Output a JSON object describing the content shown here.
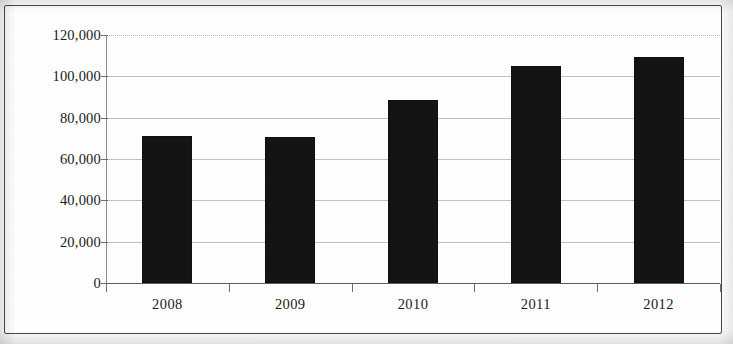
{
  "chart_data": {
    "type": "bar",
    "title": "",
    "subtitle": "",
    "xlabel": "",
    "ylabel": "",
    "categories": [
      "2008",
      "2009",
      "2010",
      "2011",
      "2012"
    ],
    "values": [
      71000,
      70500,
      88500,
      105000,
      109500
    ],
    "series": [
      {
        "name": "",
        "values": [
          71000,
          70500,
          88500,
          105000,
          109500
        ]
      }
    ],
    "ylim": [
      0,
      120000
    ],
    "y_ticks": [
      0,
      20000,
      40000,
      60000,
      80000,
      100000,
      120000
    ],
    "y_tick_labels": [
      "0",
      "20,000",
      "40,000",
      "60,000",
      "80,000",
      "100,000",
      "120,000"
    ],
    "x_tick_labels": [
      "2008",
      "2009",
      "2010",
      "2011",
      "2012"
    ],
    "grid": true,
    "grid_axis": "y",
    "legend": false,
    "legend_position": "none",
    "annotations": [],
    "bar_color": "#141414",
    "gridline_color": "#bdbdbd",
    "axis_color": "#6f6f6f",
    "frame_color": "#4a4a4a",
    "background_color": "#ffffff"
  },
  "figure": {
    "border_visible": true,
    "appearance": "scanned-photocopy"
  }
}
